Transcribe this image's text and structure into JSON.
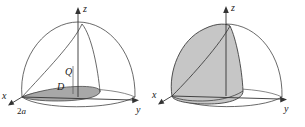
{
  "figure": {
    "background_color": "#ffffff",
    "stroke_color": "#333333",
    "region_fill_color": "#a8a8a8",
    "solid_fill_color": "#c6c6c6",
    "panels": [
      {
        "id": "left",
        "name": "region-and-hemisphere",
        "axes": [
          {
            "name": "z",
            "label": "z"
          },
          {
            "name": "y",
            "label": "y"
          },
          {
            "name": "x",
            "label": "x"
          }
        ],
        "labels": [
          {
            "name": "region-D",
            "text": "D"
          },
          {
            "name": "point-Q",
            "text": "Q"
          },
          {
            "name": "x-intercept",
            "text": "2a"
          }
        ]
      },
      {
        "id": "right",
        "name": "solid-of-integration",
        "axes": [
          {
            "name": "z",
            "label": "z"
          },
          {
            "name": "y",
            "label": "y"
          },
          {
            "name": "x",
            "label": "x"
          }
        ],
        "labels": []
      }
    ]
  }
}
